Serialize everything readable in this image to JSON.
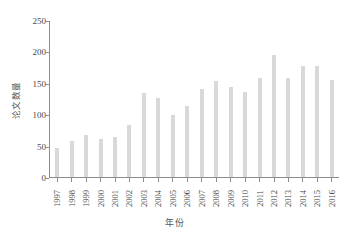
{
  "chart_data": {
    "type": "bar",
    "title": "",
    "xlabel": "年份",
    "ylabel": "论文数量",
    "categories": [
      "1997",
      "1998",
      "1999",
      "2000",
      "2001",
      "2002",
      "2003",
      "2004",
      "2005",
      "2006",
      "2007",
      "2008",
      "2009",
      "2010",
      "2011",
      "2012",
      "2013",
      "2014",
      "2015",
      "2016"
    ],
    "values": [
      46,
      58,
      67,
      60,
      64,
      83,
      134,
      126,
      98,
      113,
      140,
      153,
      143,
      135,
      157,
      194,
      157,
      176,
      176,
      154
    ],
    "series": [
      {
        "name": "论文数量",
        "values": [
          46,
          58,
          67,
          60,
          64,
          83,
          134,
          126,
          98,
          113,
          140,
          153,
          143,
          135,
          157,
          194,
          157,
          176,
          176,
          154
        ]
      }
    ],
    "ylim": [
      0,
      250
    ],
    "ytick_values": [
      0,
      50,
      100,
      150,
      200,
      250
    ],
    "ytick_labels": [
      "0",
      "50",
      "100",
      "150",
      "200",
      "250"
    ],
    "grid": false,
    "legend": false,
    "bar_color": "#d9d9d9",
    "axis_color": "#8d8d8d",
    "background_color": "#ffffff"
  }
}
